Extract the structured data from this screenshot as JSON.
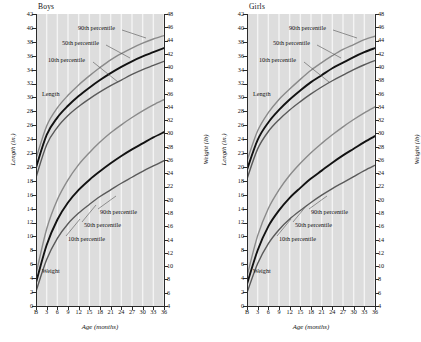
{
  "figure": {
    "xlabel": "Age (months)",
    "ylabel_left": "Length (in.)",
    "ylabel_right": "Weight (lb)"
  },
  "panels": [
    {
      "title": "Boys"
    },
    {
      "title": "Girls"
    }
  ],
  "annotations": {
    "p90": "90th percentile",
    "p50": "50th percentile",
    "p10": "10th percentile",
    "length": "Length",
    "weight": "Weight"
  },
  "chart_data": {
    "type": "line",
    "xlabel": "Age (months)",
    "ylabel": "Length (in.)",
    "ylabel_secondary": "Weight (lb)",
    "grid": "vertical",
    "legend": "inline annotations",
    "x": [
      0,
      3,
      6,
      9,
      12,
      15,
      18,
      21,
      24,
      27,
      30,
      33,
      36
    ],
    "xtick_labels": [
      "B",
      "3",
      "6",
      "9",
      "12",
      "15",
      "18",
      "21",
      "24",
      "27",
      "30",
      "33",
      "36"
    ],
    "xlim": [
      0,
      36
    ],
    "ylim_left": [
      0,
      42
    ],
    "ylim_right": [
      4,
      48
    ],
    "ytick_left": [
      0,
      2,
      4,
      6,
      8,
      10,
      12,
      14,
      16,
      18,
      20,
      22,
      24,
      26,
      28,
      30,
      32,
      34,
      36,
      38,
      40,
      42
    ],
    "ytick_right": [
      4,
      6,
      8,
      10,
      12,
      14,
      16,
      18,
      20,
      22,
      24,
      26,
      28,
      30,
      32,
      34,
      36,
      38,
      40,
      42,
      44,
      46,
      48
    ],
    "panels": [
      {
        "name": "Boys",
        "series": [
          {
            "name": "Length 90th percentile",
            "axis": "left",
            "units": "in.",
            "color": "#8a8a8a",
            "values": [
              21.2,
              25.9,
              28.5,
              30.3,
              31.8,
              33.1,
              34.3,
              35.4,
              36.3,
              37.1,
              37.8,
              38.4,
              38.9
            ]
          },
          {
            "name": "Length 50th percentile",
            "axis": "left",
            "units": "in.",
            "color": "#121212",
            "values": [
              19.9,
              24.6,
              27.1,
              28.8,
              30.2,
              31.4,
              32.5,
              33.5,
              34.4,
              35.2,
              35.9,
              36.5,
              37.1
            ]
          },
          {
            "name": "Length 10th percentile",
            "axis": "left",
            "units": "in.",
            "color": "#5a5a5a",
            "values": [
              18.5,
              23.2,
              25.7,
              27.4,
              28.7,
              29.8,
              30.8,
              31.7,
              32.5,
              33.3,
              34.0,
              34.6,
              35.2
            ]
          },
          {
            "name": "Weight 90th percentile",
            "axis": "right",
            "units": "lb",
            "color": "#8a8a8a",
            "values": [
              8.8,
              15.6,
              20.0,
              23.0,
              25.3,
              27.1,
              28.7,
              30.1,
              31.3,
              32.4,
              33.4,
              34.3,
              35.1
            ]
          },
          {
            "name": "Weight 50th percentile",
            "axis": "right",
            "units": "lb",
            "color": "#121212",
            "values": [
              7.5,
              13.2,
              17.0,
              19.6,
              21.5,
              23.0,
              24.3,
              25.5,
              26.6,
              27.6,
              28.5,
              29.4,
              30.2
            ]
          },
          {
            "name": "Weight 10th percentile",
            "axis": "right",
            "units": "lb",
            "color": "#5a5a5a",
            "values": [
              6.2,
              11.0,
              14.2,
              16.4,
              18.0,
              19.3,
              20.5,
              21.5,
              22.5,
              23.4,
              24.3,
              25.1,
              25.9
            ]
          }
        ]
      },
      {
        "name": "Girls",
        "series": [
          {
            "name": "Length 90th percentile",
            "axis": "left",
            "units": "in.",
            "color": "#8a8a8a",
            "values": [
              20.9,
              25.2,
              27.8,
              29.7,
              31.2,
              32.6,
              33.9,
              35.0,
              36.0,
              36.9,
              37.6,
              38.3,
              38.8
            ]
          },
          {
            "name": "Length 50th percentile",
            "axis": "left",
            "units": "in.",
            "color": "#121212",
            "values": [
              19.6,
              23.9,
              26.4,
              28.2,
              29.7,
              31.0,
              32.2,
              33.2,
              34.2,
              35.0,
              35.8,
              36.5,
              37.1
            ]
          },
          {
            "name": "Length 10th percentile",
            "axis": "left",
            "units": "in.",
            "color": "#5a5a5a",
            "values": [
              18.3,
              22.6,
              25.1,
              26.8,
              28.2,
              29.4,
              30.5,
              31.5,
              32.4,
              33.2,
              34.0,
              34.7,
              35.3
            ]
          },
          {
            "name": "Weight 90th percentile",
            "axis": "right",
            "units": "lb",
            "color": "#8a8a8a",
            "values": [
              8.5,
              14.6,
              18.7,
              21.5,
              23.7,
              25.5,
              27.1,
              28.5,
              29.8,
              31.0,
              32.1,
              33.1,
              34.0
            ]
          },
          {
            "name": "Weight 50th percentile",
            "axis": "right",
            "units": "lb",
            "color": "#121212",
            "values": [
              7.3,
              12.4,
              16.0,
              18.4,
              20.3,
              21.8,
              23.2,
              24.4,
              25.6,
              26.7,
              27.7,
              28.7,
              29.6
            ]
          },
          {
            "name": "Weight 10th percentile",
            "axis": "right",
            "units": "lb",
            "color": "#5a5a5a",
            "values": [
              6.0,
              10.4,
              13.4,
              15.5,
              17.1,
              18.4,
              19.6,
              20.7,
              21.7,
              22.6,
              23.5,
              24.4,
              25.2
            ]
          }
        ]
      }
    ]
  }
}
